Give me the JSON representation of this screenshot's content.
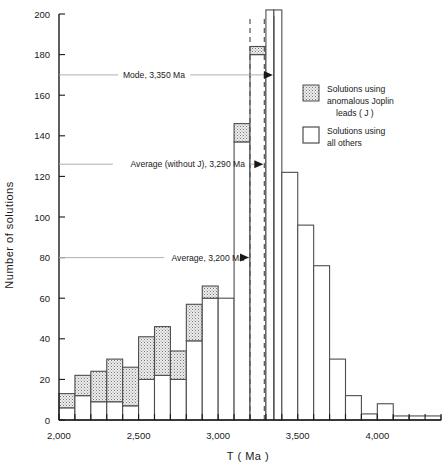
{
  "chart_data": {
    "type": "bar",
    "title": "",
    "subtitle": "",
    "xlabel": "T  ( Ma )",
    "ylabel": "Number of solutions",
    "xlim": [
      2000,
      4400
    ],
    "ylim": [
      0,
      200
    ],
    "xtick_step": 100,
    "ytick_step": 20,
    "xticks_labeled": [
      {
        "value": 2000,
        "label": "2,000"
      },
      {
        "value": 2500,
        "label": "2,500"
      },
      {
        "value": 3000,
        "label": "3,000"
      },
      {
        "value": 3500,
        "label": "3,500"
      },
      {
        "value": 4000,
        "label": "4,000"
      }
    ],
    "yticks_labeled": [
      {
        "value": 0,
        "label": "0"
      },
      {
        "value": 20,
        "label": "20"
      },
      {
        "value": 40,
        "label": "40"
      },
      {
        "value": 60,
        "label": "60"
      },
      {
        "value": 80,
        "label": "80"
      },
      {
        "value": 100,
        "label": "100"
      },
      {
        "value": 120,
        "label": "120"
      },
      {
        "value": 140,
        "label": "140"
      },
      {
        "value": 160,
        "label": "160"
      },
      {
        "value": 180,
        "label": "180"
      },
      {
        "value": 200,
        "label": "200"
      }
    ],
    "grid": false,
    "legend_position": "right-inside",
    "bin_width": 100,
    "stacked": true,
    "series": [
      {
        "name": "Solutions using all others",
        "fill": "white",
        "values": [
          6,
          12,
          9,
          9,
          7,
          20,
          22,
          20,
          39,
          60,
          60,
          137,
          180,
          202,
          202,
          122,
          96,
          76,
          30,
          12,
          3,
          2,
          2,
          2
        ]
      },
      {
        "name": "Solutions using anomalous Joplin leads ( J )",
        "fill": "stipple",
        "values": [
          7,
          10,
          15,
          21,
          19,
          21,
          24,
          14,
          18,
          6,
          0,
          9,
          4,
          0,
          0,
          0,
          0,
          0,
          0,
          0,
          0,
          0,
          0,
          0
        ]
      }
    ],
    "bins": [
      {
        "x0": 2000,
        "x1": 2100,
        "total": 13,
        "white": 6,
        "stipple": 7
      },
      {
        "x0": 2100,
        "x1": 2200,
        "total": 22,
        "white": 12,
        "stipple": 10
      },
      {
        "x0": 2200,
        "x1": 2300,
        "total": 24,
        "white": 9,
        "stipple": 15
      },
      {
        "x0": 2300,
        "x1": 2400,
        "total": 30,
        "white": 9,
        "stipple": 21
      },
      {
        "x0": 2400,
        "x1": 2500,
        "total": 26,
        "white": 7,
        "stipple": 19
      },
      {
        "x0": 2500,
        "x1": 2600,
        "total": 41,
        "white": 20,
        "stipple": 21
      },
      {
        "x0": 2600,
        "x1": 2700,
        "total": 46,
        "white": 22,
        "stipple": 24
      },
      {
        "x0": 2700,
        "x1": 2800,
        "total": 34,
        "white": 20,
        "stipple": 14
      },
      {
        "x0": 2800,
        "x1": 2900,
        "total": 57,
        "white": 39,
        "stipple": 18
      },
      {
        "x0": 2900,
        "x1": 3000,
        "total": 66,
        "white": 60,
        "stipple": 6
      },
      {
        "x0": 3000,
        "x1": 3100,
        "total": 60,
        "white": 60,
        "stipple": 0
      },
      {
        "x0": 3100,
        "x1": 3200,
        "total": 146,
        "white": 137,
        "stipple": 9
      },
      {
        "x0": 3200,
        "x1": 3300,
        "total": 184,
        "white": 180,
        "stipple": 4
      },
      {
        "x0": 3300,
        "x1": 3350,
        "total": 202,
        "white": 202,
        "stipple": 0
      },
      {
        "x0": 3350,
        "x1": 3400,
        "total": 202,
        "white": 202,
        "stipple": 0
      },
      {
        "x0": 3400,
        "x1": 3500,
        "total": 122,
        "white": 122,
        "stipple": 0
      },
      {
        "x0": 3500,
        "x1": 3600,
        "total": 96,
        "white": 96,
        "stipple": 0
      },
      {
        "x0": 3600,
        "x1": 3700,
        "total": 76,
        "white": 76,
        "stipple": 0
      },
      {
        "x0": 3700,
        "x1": 3800,
        "total": 30,
        "white": 30,
        "stipple": 0
      },
      {
        "x0": 3800,
        "x1": 3900,
        "total": 12,
        "white": 12,
        "stipple": 0
      },
      {
        "x0": 3900,
        "x1": 4000,
        "total": 3,
        "white": 3,
        "stipple": 0
      },
      {
        "x0": 4000,
        "x1": 4100,
        "total": 8,
        "white": 8,
        "stipple": 0
      },
      {
        "x0": 4100,
        "x1": 4200,
        "total": 2,
        "white": 2,
        "stipple": 0
      },
      {
        "x0": 4200,
        "x1": 4400,
        "total": 2,
        "white": 2,
        "stipple": 0
      }
    ],
    "annotations": [
      {
        "id": "mode",
        "label": "Mode, 3,350 Ma",
        "x_value": 3350,
        "y_value": 170,
        "line_style": "solid"
      },
      {
        "id": "average-no-j",
        "label": "Average (without J), 3,290 Ma",
        "x_value": 3290,
        "y_value": 126,
        "line_style": "dashed"
      },
      {
        "id": "average",
        "label": "Average, 3,200 Ma",
        "x_value": 3200,
        "y_value": 80,
        "line_style": "dashed"
      }
    ],
    "colors": {
      "axis": "#1a1a1a",
      "bar_outline": "#4d4d4d",
      "bar_white_fill": "#ffffff",
      "bar_stipple_fill": "#e8e8e8",
      "stipple_dot": "#6b6b6b",
      "leader_line": "#b0b0b0",
      "reference_line": "#555555"
    }
  },
  "legend": {
    "entries": [
      {
        "swatch": "stipple",
        "lines": [
          "Solutions using",
          "anomalous Joplin",
          "leads  ( J )"
        ]
      },
      {
        "swatch": "white",
        "lines": [
          "Solutions using",
          "all others"
        ]
      }
    ]
  },
  "axis": {
    "x_title": "T  ( Ma )",
    "y_title": "Number of solutions"
  },
  "annotation_text": {
    "mode": "Mode, 3,350 Ma",
    "average_no_j": "Average (without J), 3,290 Ma",
    "average": "Average, 3,200 Ma"
  },
  "legend_text": {
    "e0_l0": "Solutions using",
    "e0_l1": "anomalous Joplin",
    "e0_l2": "leads  ( J )",
    "e1_l0": "Solutions using",
    "e1_l1": "all others"
  }
}
